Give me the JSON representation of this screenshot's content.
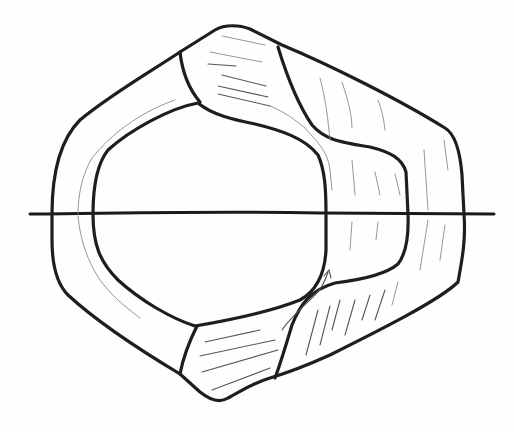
{
  "figure": {
    "kind": "hand-drawn sketch",
    "colors": {
      "background": "#fefefe",
      "line": "#1e1e1e",
      "hatch": "#8a8a8a"
    },
    "labels": []
  }
}
